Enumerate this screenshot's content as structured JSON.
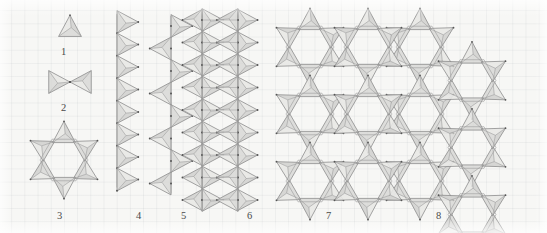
{
  "figure": {
    "caption_labels": [
      {
        "id": "1",
        "text": "1",
        "x": 61,
        "y": 47
      },
      {
        "id": "2",
        "text": "2",
        "x": 61,
        "y": 103
      },
      {
        "id": "3",
        "text": "3",
        "x": 57,
        "y": 211
      },
      {
        "id": "4",
        "text": "4",
        "x": 136,
        "y": 211
      },
      {
        "id": "5",
        "text": "5",
        "x": 181,
        "y": 211
      },
      {
        "id": "6",
        "text": "6",
        "x": 247,
        "y": 211
      },
      {
        "id": "7",
        "text": "7",
        "x": 326,
        "y": 211
      },
      {
        "id": "8",
        "text": "8",
        "x": 436,
        "y": 211
      }
    ],
    "colors": {
      "background": "#f7f7f5",
      "grid_line": "#dfe3e6",
      "polygon_fill": "#d4d4d2",
      "polygon_fill_light": "#e8e8e6",
      "polygon_stroke": "#8d8d8d",
      "inner_line": "#9a9a9a",
      "vertex": "#555555",
      "label_text": "#4a4a4a"
    },
    "motifs": [
      {
        "number": "1",
        "name": "isolated-tetrahedron",
        "type": "single",
        "centers": [
          [
            70,
            26
          ]
        ],
        "orientations": [
          "up"
        ],
        "size": 19
      },
      {
        "number": "2",
        "name": "corner-sharing-dimer",
        "type": "dimer",
        "centers": [
          [
            55,
            82
          ],
          [
            85,
            82
          ]
        ],
        "orientations": [
          "right",
          "left"
        ],
        "size": 19
      },
      {
        "number": "3",
        "name": "six-membered-ring",
        "type": "ring",
        "center": [
          64,
          160
        ],
        "ring_radius": 30,
        "point_count": 6,
        "size": 19
      },
      {
        "number": "4",
        "name": "single-chain-same-side",
        "type": "chain",
        "axis_x": 117,
        "y_start": 22,
        "y_step": 22.5,
        "repeat": 8,
        "orientation": "right",
        "size": 19
      },
      {
        "number": "5",
        "name": "zigzag-chain-alternating",
        "type": "zigzag",
        "axis_x": 171,
        "y_start": 26,
        "y_step": 22.5,
        "repeat": 8,
        "size": 19
      },
      {
        "number": "6",
        "name": "double-chain-ribbon",
        "type": "ribbon",
        "left_x": 202,
        "right_x": 238,
        "y_start": 20,
        "y_step": 22.5,
        "repeat": 9,
        "size": 19
      },
      {
        "number": "7",
        "name": "star-column-fused-rings",
        "type": "ring-column",
        "center_x": 310,
        "y_start": 47,
        "y_step": 67,
        "repeat": 3,
        "ring_radius": 30,
        "size": 19
      },
      {
        "number": "8",
        "name": "two-dimensional-sheet",
        "type": "sheet",
        "col_x": [
          420,
          472
        ],
        "y_start": 47,
        "y_step": 67,
        "rows": 3,
        "ring_radius": 30,
        "size": 19
      }
    ]
  }
}
